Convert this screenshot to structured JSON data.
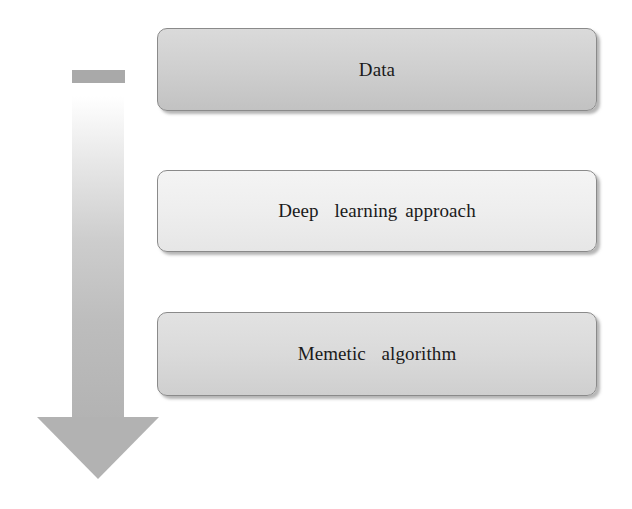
{
  "diagram": {
    "type": "sequential-flow",
    "direction": "top-to-bottom",
    "steps": [
      {
        "label": "Data"
      },
      {
        "label": "Deep  learning approach"
      },
      {
        "label": "Memetic  algorithm"
      }
    ],
    "colors": {
      "arrow": "#b2b2b2",
      "box_1_fill": "#cfcfcf",
      "box_2_fill": "#eeeeee",
      "box_3_fill": "#dadada",
      "box_border": "#8a8a8a",
      "text": "#1a1a1a"
    }
  }
}
